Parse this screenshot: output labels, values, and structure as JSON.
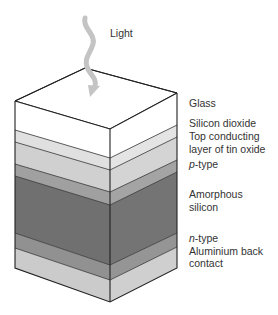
{
  "figure": {
    "light_label": "Light",
    "layers": [
      {
        "name": "Glass",
        "label_lines": [
          "Glass"
        ],
        "color": "#ffffff",
        "left": [
          101,
          130
        ],
        "center": [
          129,
          158
        ],
        "right": [
          93,
          125
        ]
      },
      {
        "name": "Silicon dioxide",
        "label_lines": [
          "Silicon dioxide"
        ],
        "color": "#e2e2e2",
        "left": [
          130,
          142
        ],
        "center": [
          158,
          170
        ],
        "right": [
          125,
          137
        ]
      },
      {
        "name": "Top conducting layer of tin oxide",
        "label_lines": [
          "Top conducting",
          "layer of tin oxide"
        ],
        "color": "#d2d2d2",
        "left": [
          142,
          164
        ],
        "center": [
          170,
          192
        ],
        "right": [
          137,
          160
        ]
      },
      {
        "name": "p-type",
        "label_lines": [
          "p-type"
        ],
        "italic_prefix": "p",
        "color": "#a2a2a2",
        "left": [
          164,
          176
        ],
        "center": [
          192,
          205
        ],
        "right": [
          160,
          172
        ]
      },
      {
        "name": "Amorphous silicon",
        "label_lines": [
          "Amorphous",
          "silicon"
        ],
        "color": "#727272",
        "left": [
          176,
          233
        ],
        "center": [
          205,
          265
        ],
        "right": [
          172,
          233
        ]
      },
      {
        "name": "n-type",
        "label_lines": [
          "n-type"
        ],
        "italic_prefix": "n",
        "color": "#939393",
        "left": [
          233,
          248
        ],
        "center": [
          265,
          280
        ],
        "right": [
          233,
          247
        ]
      },
      {
        "name": "Aluminium back contact",
        "label_lines": [
          "Aluminium back",
          "contact"
        ],
        "color": "#cdcdcd",
        "left": [
          248,
          268
        ],
        "center": [
          280,
          302
        ],
        "right": [
          247,
          268
        ]
      }
    ],
    "labels": {
      "glass": "Glass",
      "silicon_dioxide": "Silicon dioxide",
      "tin_oxide_1": "Top conducting",
      "tin_oxide_2": "layer of tin oxide",
      "p_type_prefix": "p",
      "p_type_suffix": "-type",
      "amorphous_1": "Amorphous",
      "amorphous_2": "silicon",
      "n_type_prefix": "n",
      "n_type_suffix": "-type",
      "aluminium_1": "Aluminium back",
      "aluminium_2": "contact"
    },
    "colors": {
      "outline": "#222222",
      "arrow": "#c4c4c4",
      "text": "#333333"
    }
  }
}
